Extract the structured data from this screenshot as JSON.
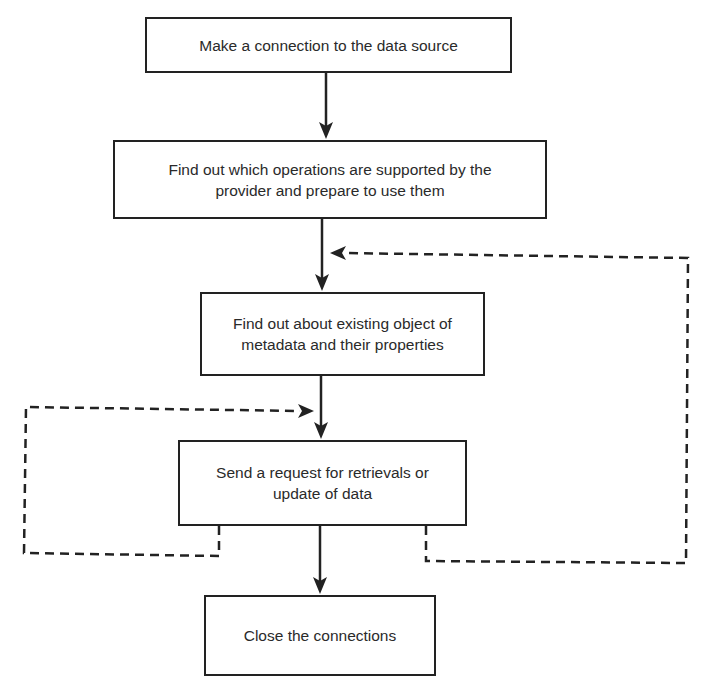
{
  "diagram": {
    "type": "flowchart",
    "direction": "top-to-bottom",
    "nodes": [
      {
        "id": "n1",
        "lines": [
          "Make a connection to the data source"
        ]
      },
      {
        "id": "n2",
        "lines": [
          "Find out which operations are supported by the",
          "provider and prepare to use them"
        ]
      },
      {
        "id": "n3",
        "lines": [
          "Find out about existing object of",
          "metadata and their properties"
        ]
      },
      {
        "id": "n4",
        "lines": [
          "Send a request for retrievals or",
          "update of data"
        ]
      },
      {
        "id": "n5",
        "lines": [
          "Close the connections"
        ]
      }
    ],
    "edges": [
      {
        "from": "n1",
        "to": "n2",
        "style": "solid"
      },
      {
        "from": "n2",
        "to": "n3",
        "style": "solid"
      },
      {
        "from": "n3",
        "to": "n4",
        "style": "solid"
      },
      {
        "from": "n4",
        "to": "n5",
        "style": "solid"
      },
      {
        "from": "n4",
        "to": "n3",
        "style": "dashed",
        "route": "right-loop"
      },
      {
        "from": "n4",
        "to": "n4",
        "style": "dashed",
        "route": "left-loop"
      }
    ],
    "colors": {
      "stroke": "#222222",
      "text": "#2a2a2a",
      "background": "#ffffff"
    }
  }
}
